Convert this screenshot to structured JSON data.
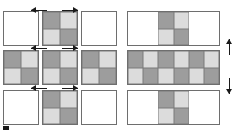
{
  "figure": {
    "title": "Periodic tiling of a unit cell",
    "colors": {
      "dark_cell": "#9d9d9d",
      "light_cell": "#dcdcdc",
      "empty_cell": "#ffffff",
      "tile_border": "#6e6e6e",
      "arrow": "#1a1a1a",
      "background": "#ffffff"
    }
  },
  "left_panel": {
    "name": "square-tiling-panel",
    "description": "3 by 3 arrangement of square tiles; the centre column and centre row carry the 2x2 unit-cell pattern",
    "rows": 3,
    "cols": 3,
    "tiles": [
      {
        "id": "tl",
        "row": 0,
        "col": 0,
        "patterned": false,
        "cells": []
      },
      {
        "id": "tc",
        "row": 0,
        "col": 1,
        "patterned": true,
        "cells": [
          "dark",
          "light",
          "light",
          "dark"
        ]
      },
      {
        "id": "tr",
        "row": 0,
        "col": 2,
        "patterned": false,
        "cells": []
      },
      {
        "id": "ml",
        "row": 1,
        "col": 0,
        "patterned": true,
        "cells": [
          "dark",
          "light",
          "light",
          "dark"
        ]
      },
      {
        "id": "mc",
        "row": 1,
        "col": 1,
        "patterned": true,
        "cells": [
          "dark",
          "light",
          "light",
          "dark"
        ]
      },
      {
        "id": "mr",
        "row": 1,
        "col": 2,
        "patterned": true,
        "cells": [
          "dark",
          "light",
          "light",
          "dark"
        ]
      },
      {
        "id": "bl",
        "row": 2,
        "col": 0,
        "patterned": false,
        "cells": []
      },
      {
        "id": "bc",
        "row": 2,
        "col": 1,
        "patterned": true,
        "cells": [
          "dark",
          "light",
          "light",
          "dark"
        ]
      },
      {
        "id": "br",
        "row": 2,
        "col": 2,
        "patterned": false,
        "cells": []
      }
    ],
    "arrows": [
      {
        "id": "top-left-arrow",
        "direction": "left",
        "x": 31,
        "y": 6,
        "length": 16
      },
      {
        "id": "top-right-arrow",
        "direction": "right",
        "x": 62,
        "y": 6,
        "length": 16
      },
      {
        "id": "middle-left-arrow",
        "direction": "left",
        "x": 31,
        "y": 44,
        "length": 16
      },
      {
        "id": "middle-right-arrow",
        "direction": "right",
        "x": 62,
        "y": 44,
        "length": 16
      },
      {
        "id": "bottom-left-arrow",
        "direction": "left",
        "x": 31,
        "y": 84,
        "length": 16
      },
      {
        "id": "bottom-right-arrow",
        "direction": "right",
        "x": 62,
        "y": 84,
        "length": 16
      }
    ],
    "corner_marker": {
      "id": "origin-marker",
      "x": 3,
      "y": 126,
      "width": 6,
      "height": 4
    }
  },
  "right_panel": {
    "name": "wide-strip-panel",
    "description": "3 stacked wide rectangles; the middle strip is fully tiled 6x2, the top and bottom strips show only the central 2x2 unit cell",
    "rows": 3,
    "strips": [
      {
        "id": "top-strip",
        "cols": 6,
        "sub_rows": 2,
        "cells": [
          "empty",
          "empty",
          "dark",
          "light",
          "empty",
          "empty",
          "empty",
          "empty",
          "light",
          "dark",
          "empty",
          "empty"
        ]
      },
      {
        "id": "middle-strip",
        "cols": 6,
        "sub_rows": 2,
        "cells": [
          "dark",
          "light",
          "dark",
          "light",
          "dark",
          "light",
          "light",
          "dark",
          "light",
          "dark",
          "light",
          "dark"
        ]
      },
      {
        "id": "bottom-strip",
        "cols": 6,
        "sub_rows": 2,
        "cells": [
          "empty",
          "empty",
          "dark",
          "light",
          "empty",
          "empty",
          "empty",
          "empty",
          "light",
          "dark",
          "empty",
          "empty"
        ]
      }
    ],
    "arrows": [
      {
        "id": "right-up-arrow",
        "direction": "up",
        "x": 225,
        "y": 39,
        "length": 16
      },
      {
        "id": "right-down-arrow",
        "direction": "down",
        "x": 225,
        "y": 78,
        "length": 16
      }
    ]
  }
}
